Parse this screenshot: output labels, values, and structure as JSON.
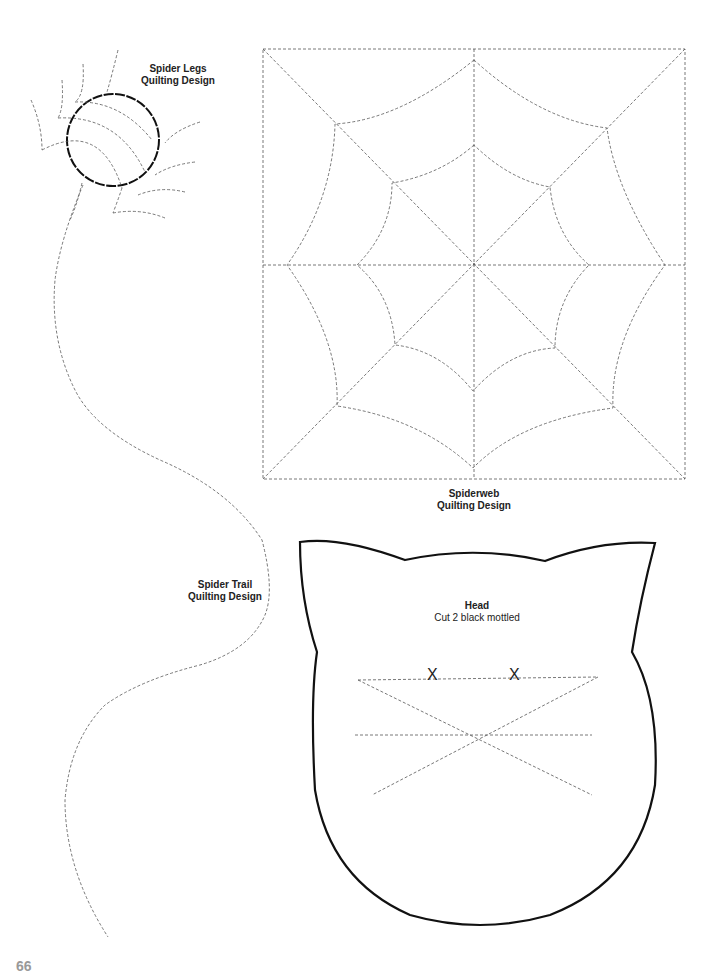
{
  "labels": {
    "spider_legs": {
      "title": "Spider Legs",
      "subtitle": "Quilting Design"
    },
    "spiderweb": {
      "title": "Spiderweb",
      "subtitle": "Quilting Design"
    },
    "spider_trail": {
      "title": "Spider Trail",
      "subtitle": "Quilting Design"
    },
    "head": {
      "title": "Head",
      "subtitle": "Cut 2 black mottled"
    }
  },
  "eyes": {
    "left": "X",
    "right": "X"
  },
  "page_number": "66",
  "colors": {
    "solid_line": "#111111",
    "dashed_line": "#555555",
    "background": "#ffffff"
  }
}
